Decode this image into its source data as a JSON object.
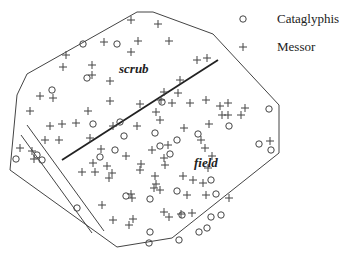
{
  "legend": {
    "items": [
      {
        "symbol": "circle",
        "label": "Cataglyphis"
      },
      {
        "symbol": "plus",
        "label": "Messor"
      }
    ]
  },
  "regions": {
    "scrub": "scrub",
    "field": "field"
  },
  "colors": {
    "stroke": "#333333",
    "background": "#ffffff"
  },
  "chart_data": {
    "type": "scatter",
    "title": "",
    "legend_entries": [
      "Cataglyphis",
      "Messor"
    ],
    "annotations": [
      "scrub",
      "field"
    ],
    "boundary_polygon": [
      [
        137,
        12
      ],
      [
        153,
        12
      ],
      [
        213,
        34
      ],
      [
        279,
        105
      ],
      [
        279,
        153
      ],
      [
        172,
        238
      ],
      [
        117,
        247
      ],
      [
        10,
        170
      ],
      [
        17,
        95
      ],
      [
        27,
        74
      ]
    ],
    "lines": [
      {
        "name": "scrub-field divider",
        "from": [
          62,
          160
        ],
        "to": [
          218,
          60
        ],
        "weight": "thick"
      },
      {
        "name": "track-a",
        "from": [
          21,
          135
        ],
        "to": [
          92,
          233
        ]
      },
      {
        "name": "track-b",
        "from": [
          27,
          125
        ],
        "to": [
          104,
          231
        ]
      }
    ],
    "series": [
      {
        "name": "Cataglyphis",
        "marker": "circle",
        "points": [
          [
            83,
            44
          ],
          [
            117,
            44
          ],
          [
            87,
            78
          ],
          [
            52,
            90
          ],
          [
            120,
            122
          ],
          [
            93,
            124
          ],
          [
            269,
            109
          ],
          [
            16,
            159
          ],
          [
            37,
            155
          ],
          [
            42,
            160
          ],
          [
            124,
            136
          ],
          [
            115,
            150
          ],
          [
            162,
            102
          ],
          [
            155,
            133
          ],
          [
            160,
            146
          ],
          [
            177,
            140
          ],
          [
            198,
            134
          ],
          [
            170,
            154
          ],
          [
            229,
            126
          ],
          [
            259,
            144
          ],
          [
            271,
            150
          ],
          [
            211,
            180
          ],
          [
            177,
            191
          ],
          [
            216,
            194
          ],
          [
            126,
            196
          ],
          [
            150,
            199
          ],
          [
            182,
            215
          ],
          [
            179,
            240
          ],
          [
            199,
            232
          ],
          [
            207,
            228
          ],
          [
            211,
            217
          ],
          [
            221,
            215
          ],
          [
            150,
            232
          ],
          [
            149,
            243
          ],
          [
            77,
            208
          ],
          [
            100,
            157
          ]
        ]
      },
      {
        "name": "Messor",
        "marker": "plus",
        "points": [
          [
            131,
            20
          ],
          [
            158,
            24
          ],
          [
            66,
            55
          ],
          [
            104,
            42
          ],
          [
            138,
            41
          ],
          [
            169,
            41
          ],
          [
            63,
            67
          ],
          [
            92,
            65
          ],
          [
            131,
            52
          ],
          [
            92,
            75
          ],
          [
            110,
            81
          ],
          [
            197,
            60
          ],
          [
            207,
            58
          ],
          [
            40,
            96
          ],
          [
            53,
            98
          ],
          [
            30,
            111
          ],
          [
            88,
            111
          ],
          [
            50,
            126
          ],
          [
            62,
            124
          ],
          [
            76,
            123
          ],
          [
            45,
            140
          ],
          [
            59,
            140
          ],
          [
            90,
            138
          ],
          [
            113,
            126
          ],
          [
            110,
            101
          ],
          [
            161,
            100
          ],
          [
            180,
            80
          ],
          [
            140,
            104
          ],
          [
            172,
            103
          ],
          [
            164,
            92
          ],
          [
            190,
            103
          ],
          [
            206,
            100
          ],
          [
            156,
            112
          ],
          [
            178,
            93
          ],
          [
            160,
            120
          ],
          [
            220,
            106
          ],
          [
            228,
            103
          ],
          [
            222,
            115
          ],
          [
            228,
            115
          ],
          [
            209,
            124
          ],
          [
            137,
            126
          ],
          [
            184,
            128
          ],
          [
            101,
            149
          ],
          [
            152,
            150
          ],
          [
            168,
            145
          ],
          [
            201,
            140
          ],
          [
            205,
            148
          ],
          [
            208,
            168
          ],
          [
            212,
            156
          ],
          [
            20,
            148
          ],
          [
            34,
            159
          ],
          [
            32,
            151
          ],
          [
            93,
            163
          ],
          [
            82,
            172
          ],
          [
            95,
            172
          ],
          [
            112,
            173
          ],
          [
            126,
            156
          ],
          [
            141,
            164
          ],
          [
            164,
            158
          ],
          [
            155,
            176
          ],
          [
            156,
            184
          ],
          [
            165,
            165
          ],
          [
            160,
            190
          ],
          [
            183,
            176
          ],
          [
            203,
            183
          ],
          [
            187,
            195
          ],
          [
            193,
            180
          ],
          [
            206,
            195
          ],
          [
            154,
            188
          ],
          [
            107,
            166
          ],
          [
            131,
            194
          ],
          [
            132,
            198
          ],
          [
            164,
            212
          ],
          [
            129,
            225
          ],
          [
            133,
            219
          ],
          [
            169,
            217
          ],
          [
            181,
            214
          ],
          [
            192,
            213
          ],
          [
            102,
            205
          ],
          [
            113,
            220
          ],
          [
            229,
            198
          ],
          [
            109,
            178
          ],
          [
            140,
            170
          ],
          [
            270,
            141
          ],
          [
            241,
            115
          ],
          [
            245,
            108
          ]
        ]
      }
    ],
    "grid": false,
    "legend_position": "top-right"
  }
}
